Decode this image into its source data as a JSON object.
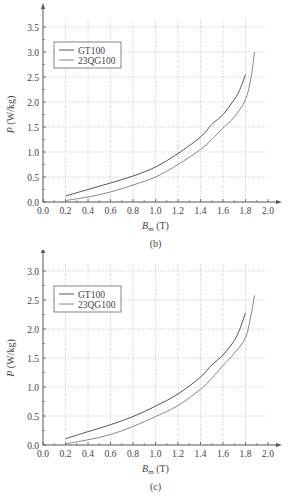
{
  "chart_data": [
    {
      "type": "line",
      "panel_label": "(b)",
      "title": "",
      "xlabel": "B_m (T)",
      "xlabel_main": "B",
      "xlabel_sub": "m",
      "xlabel_unit": " (T)",
      "ylabel": "P (W/kg)",
      "ylabel_main": "P",
      "ylabel_unit": " (W/kg)",
      "xlim": [
        0.0,
        2.0
      ],
      "ylim": [
        0.0,
        3.5
      ],
      "xticks": [
        "0.0",
        "0.2",
        "0.4",
        "0.6",
        "0.8",
        "1.0",
        "1.2",
        "1.4",
        "1.6",
        "1.8",
        "2.0"
      ],
      "yticks": [
        "0.0",
        "0.5",
        "1.0",
        "1.5",
        "2.0",
        "2.5",
        "3.0",
        "3.5"
      ],
      "grid": true,
      "legend_position": "upper-left",
      "series": [
        {
          "name": "GT100",
          "x": [
            0.2,
            0.4,
            0.6,
            0.8,
            1.0,
            1.2,
            1.4,
            1.5,
            1.6,
            1.7,
            1.75,
            1.8
          ],
          "y": [
            0.12,
            0.25,
            0.38,
            0.52,
            0.7,
            0.97,
            1.3,
            1.55,
            1.75,
            2.05,
            2.25,
            2.55
          ]
        },
        {
          "name": "23QG100",
          "x": [
            0.2,
            0.4,
            0.6,
            0.8,
            1.0,
            1.2,
            1.4,
            1.5,
            1.6,
            1.7,
            1.8,
            1.85,
            1.88
          ],
          "y": [
            0.03,
            0.1,
            0.2,
            0.34,
            0.5,
            0.75,
            1.05,
            1.25,
            1.48,
            1.7,
            2.05,
            2.5,
            3.0
          ]
        }
      ]
    },
    {
      "type": "line",
      "panel_label": "(c)",
      "title": "",
      "xlabel": "B_m (T)",
      "xlabel_main": "B",
      "xlabel_sub": "m",
      "xlabel_unit": " (T)",
      "ylabel": "P (W/kg)",
      "ylabel_main": "P",
      "ylabel_unit": " (W/kg)",
      "xlim": [
        0.0,
        2.0
      ],
      "ylim": [
        0.0,
        3.0
      ],
      "xticks": [
        "0.0",
        "0.2",
        "0.4",
        "0.6",
        "0.8",
        "1.0",
        "1.2",
        "1.4",
        "1.6",
        "1.8",
        "2.0"
      ],
      "yticks": [
        "0.0",
        "0.5",
        "1.0",
        "1.5",
        "2.0",
        "2.5",
        "3.0"
      ],
      "grid": true,
      "legend_position": "upper-left",
      "series": [
        {
          "name": "GT100",
          "x": [
            0.2,
            0.4,
            0.6,
            0.8,
            1.0,
            1.2,
            1.4,
            1.5,
            1.6,
            1.7,
            1.75,
            1.8
          ],
          "y": [
            0.11,
            0.23,
            0.35,
            0.49,
            0.67,
            0.88,
            1.17,
            1.38,
            1.55,
            1.8,
            2.0,
            2.28
          ]
        },
        {
          "name": "23QG100",
          "x": [
            0.2,
            0.4,
            0.6,
            0.8,
            1.0,
            1.2,
            1.4,
            1.5,
            1.6,
            1.7,
            1.8,
            1.85,
            1.88
          ],
          "y": [
            0.02,
            0.09,
            0.18,
            0.32,
            0.49,
            0.68,
            0.96,
            1.15,
            1.37,
            1.58,
            1.85,
            2.25,
            2.58
          ]
        }
      ]
    }
  ]
}
